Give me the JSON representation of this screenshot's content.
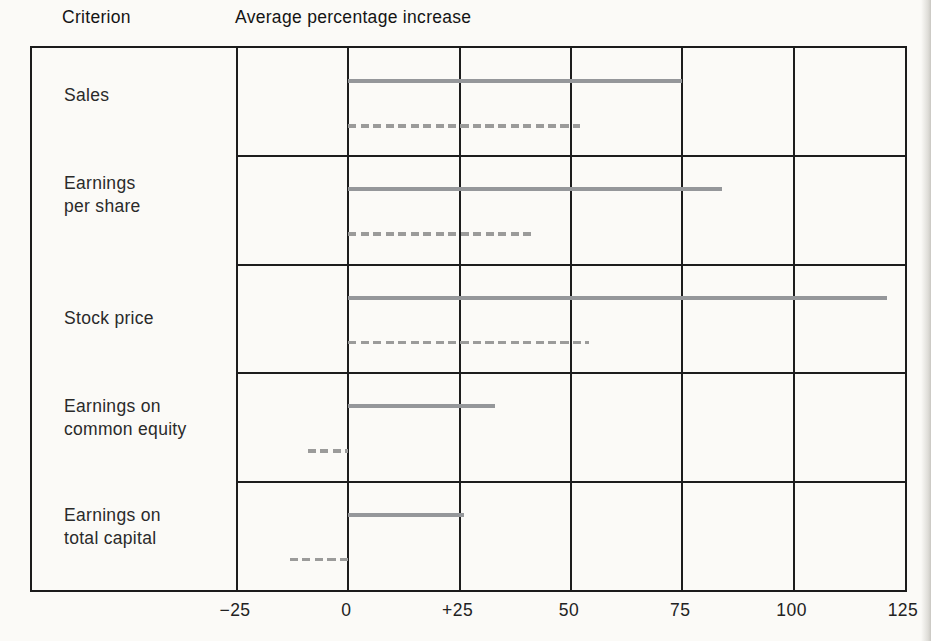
{
  "header": {
    "criterion_label": "Criterion",
    "axis_title": "Average percentage increase"
  },
  "colors": {
    "solid_bar": "#95979a",
    "dashed_bar": "#9b9b9a",
    "grid_line": "#1d1d1d",
    "background": "#fbfaf7",
    "text": "#1f1f1f"
  },
  "chart_data": {
    "type": "bar",
    "orientation": "horizontal",
    "title": "Average percentage increase",
    "row_header": "Criterion",
    "categories": [
      "Sales",
      "Earnings per share",
      "Stock price",
      "Earnings on common equity",
      "Earnings on total capital"
    ],
    "category_lines": [
      [
        "Sales"
      ],
      [
        "Earnings",
        "per share"
      ],
      [
        "Stock price"
      ],
      [
        "Earnings on",
        "common equity"
      ],
      [
        "Earnings on",
        "total capital"
      ]
    ],
    "series": [
      {
        "name": "solid-line",
        "line_style": "solid",
        "color": "#95979a",
        "ranges": [
          [
            0,
            75
          ],
          [
            0,
            84
          ],
          [
            0,
            121
          ],
          [
            0,
            33
          ],
          [
            0,
            26
          ]
        ]
      },
      {
        "name": "dashed-line",
        "line_style": "dashed",
        "color": "#9b9b9a",
        "ranges": [
          [
            0,
            52
          ],
          [
            0,
            41
          ],
          [
            0,
            54
          ],
          [
            -9,
            0
          ],
          [
            -13,
            0
          ]
        ]
      }
    ],
    "xlim": [
      -25,
      125
    ],
    "xticks": [
      -25,
      0,
      25,
      50,
      75,
      100,
      125
    ],
    "xtick_labels": [
      "−25",
      "0",
      "+25",
      "50",
      "75",
      "100",
      "125"
    ],
    "grid": true,
    "legend_position": "none"
  }
}
